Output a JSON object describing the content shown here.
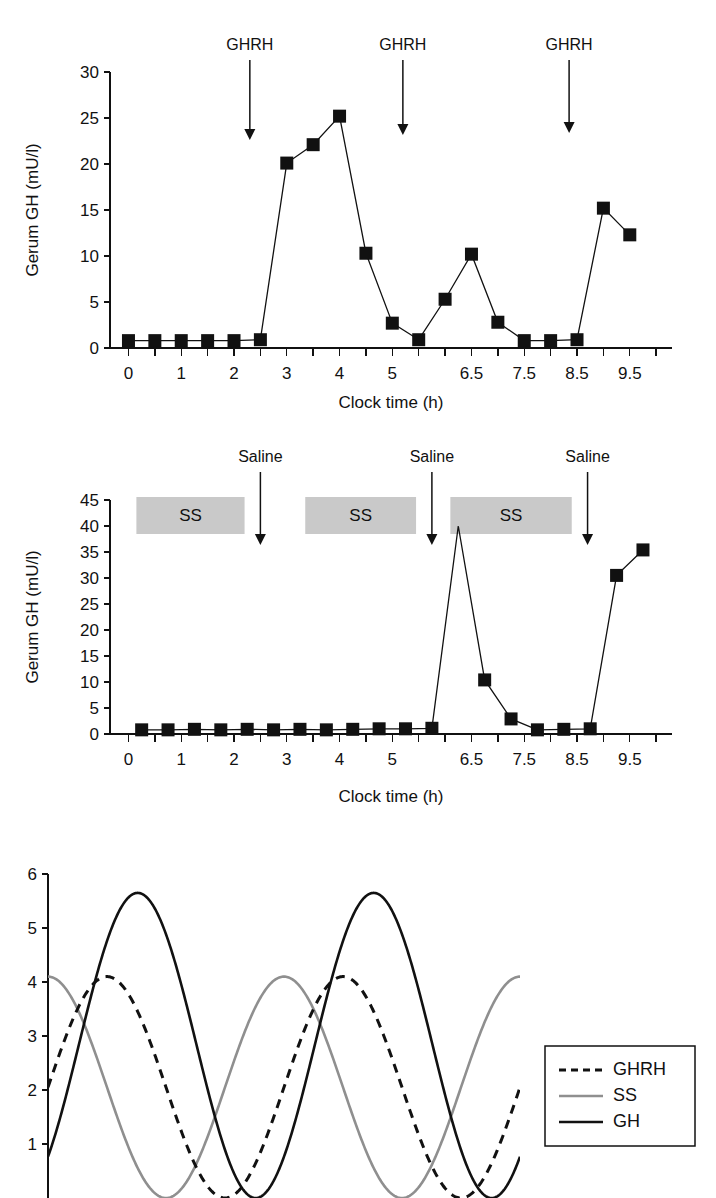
{
  "figure": {
    "panels": [
      "panel-a-ghrh",
      "panel-b-saline-ss",
      "panel-c-oscillation-model"
    ]
  },
  "panel_a": {
    "annotations": [
      {
        "label": "GHRH",
        "x_value": 2.3
      },
      {
        "label": "GHRH",
        "x_value": 5.2
      },
      {
        "label": "GHRH",
        "x_value": 8.35
      }
    ],
    "chart_data": {
      "type": "line",
      "title": "",
      "xlabel": "Clock time (h)",
      "ylabel": "Gerum GH (mU/l)",
      "xlim": [
        -0.35,
        10.3
      ],
      "ylim": [
        0,
        30
      ],
      "yticks": [
        0,
        5,
        10,
        15,
        20,
        25,
        30
      ],
      "ytick_labels": [
        "0",
        "5",
        "10",
        "15",
        "20",
        "25",
        "30"
      ],
      "xticks": [
        0,
        0.5,
        1,
        1.5,
        2,
        2.5,
        3,
        3.5,
        4,
        4.5,
        5,
        5.5,
        6,
        6.5,
        7,
        7.5,
        8,
        8.5,
        9,
        9.5,
        10
      ],
      "xtick_labels": [
        "0",
        "",
        "1",
        "",
        "2",
        "",
        "3",
        "",
        "4",
        "",
        "5",
        "",
        "6.5",
        "",
        "7.5",
        "",
        "8.5",
        "",
        "9.5",
        "",
        ""
      ],
      "xtick_labeled_values": [
        0,
        1,
        2,
        3,
        4,
        5,
        6.5,
        7.5,
        8.5,
        9.5
      ],
      "grid": false,
      "legend": "none",
      "marker": "square",
      "series": [
        {
          "name": "Serum GH",
          "x": [
            0,
            0.5,
            1,
            1.5,
            2,
            2.5,
            3,
            3.5,
            4,
            4.5,
            5,
            5.5,
            6,
            6.5,
            7,
            7.5,
            8,
            8.5,
            9,
            9.5
          ],
          "values": [
            0.8,
            0.8,
            0.8,
            0.8,
            0.8,
            0.9,
            20.1,
            22.1,
            25.2,
            10.3,
            2.7,
            0.9,
            5.3,
            10.2,
            2.8,
            0.8,
            0.8,
            0.9,
            15.2,
            12.3
          ]
        }
      ]
    }
  },
  "panel_b": {
    "annotations": [
      {
        "label": "Saline",
        "x_value": 2.5
      },
      {
        "label": "Saline",
        "x_value": 5.75
      },
      {
        "label": "Saline",
        "x_value": 8.7
      }
    ],
    "infusion_bars": [
      {
        "label": "SS",
        "x_start": 0.15,
        "x_end": 2.2
      },
      {
        "label": "SS",
        "x_start": 3.35,
        "x_end": 5.45
      },
      {
        "label": "SS",
        "x_start": 6.1,
        "x_end": 8.4
      }
    ],
    "chart_data": {
      "type": "line",
      "title": "",
      "xlabel": "Clock time (h)",
      "ylabel": "Gerum GH (mU/l)",
      "xlim": [
        -0.35,
        10.3
      ],
      "ylim": [
        0,
        45
      ],
      "yticks": [
        0,
        5,
        10,
        15,
        20,
        25,
        30,
        35,
        40,
        45
      ],
      "ytick_labels": [
        "0",
        "5",
        "10",
        "15",
        "20",
        "25",
        "30",
        "35",
        "40",
        "45"
      ],
      "xtick_labeled_values": [
        0,
        1,
        2,
        3,
        4,
        5,
        6.5,
        7.5,
        8.5,
        9.5
      ],
      "grid": false,
      "legend": "none",
      "marker": "square",
      "series": [
        {
          "name": "Serum GH",
          "x": [
            0.25,
            0.75,
            1.25,
            1.75,
            2.25,
            2.75,
            3.25,
            3.75,
            4.25,
            4.75,
            5.25,
            5.75,
            6.25,
            6.75,
            7.25,
            7.75,
            8.25,
            8.75,
            9.25,
            9.75
          ],
          "values": [
            0.8,
            0.8,
            0.9,
            0.8,
            0.9,
            0.8,
            0.9,
            0.8,
            0.9,
            1.0,
            1.0,
            1.1,
            40.0,
            10.4,
            2.9,
            0.8,
            0.9,
            1.0,
            30.5,
            35.4
          ]
        }
      ]
    }
  },
  "panel_c": {
    "legend": {
      "entries": [
        {
          "label": "GHRH",
          "style": "dashed",
          "color": "#111111"
        },
        {
          "label": "SS",
          "style": "solid",
          "color": "#8f8f8f"
        },
        {
          "label": "GH",
          "style": "solid",
          "color": "#111111"
        }
      ]
    },
    "chart_data": {
      "type": "line",
      "title": "",
      "xlabel": "",
      "ylabel": "",
      "xlim": [
        0,
        10
      ],
      "ylim": [
        0,
        6
      ],
      "yticks": [
        1,
        2,
        3,
        4,
        5,
        6
      ],
      "ytick_labels": [
        "1",
        "2",
        "3",
        "4",
        "5",
        "6"
      ],
      "xticks": [],
      "xtick_labels": [],
      "grid": false,
      "legend": "right",
      "note": "Schematic oscillating model curves; GHRH peaks ~4.1, SS peaks ~4.1 (antiphase), GH peaks ~5.65",
      "series": [
        {
          "name": "GHRH",
          "style": "dashed",
          "color": "#111111",
          "amplitude": 4.1,
          "baseline": 0,
          "period": 5.0,
          "phase_shift": 1.25,
          "peaks": [
            2.0,
            7.0
          ],
          "peak_value": 4.1
        },
        {
          "name": "SS",
          "style": "solid",
          "color": "#8f8f8f",
          "amplitude": 4.1,
          "baseline": 0,
          "period": 5.0,
          "phase_shift": 0,
          "peaks": [
            0.0,
            5.0,
            10.0
          ],
          "peak_value": 4.1
        },
        {
          "name": "GH",
          "style": "solid",
          "color": "#111111",
          "amplitude": 5.65,
          "baseline": 0,
          "period": 5.0,
          "phase_shift": 1.9,
          "peaks": [
            2.6,
            7.6
          ],
          "peak_value": 5.65
        }
      ]
    }
  }
}
